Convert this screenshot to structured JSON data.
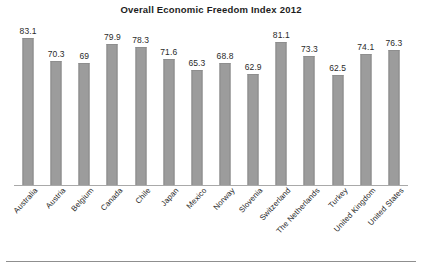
{
  "chart_data": {
    "type": "bar",
    "title": "Overall Economic Freedom Index 2012",
    "xlabel": "",
    "ylabel": "",
    "ylim": [
      0,
      90
    ],
    "grid": false,
    "legend": "none",
    "axis_visible": {
      "x": true,
      "y": false
    },
    "categories": [
      "Australia",
      "Austria",
      "Belgium",
      "Canada",
      "Chile",
      "Japan",
      "Mexico",
      "Norway",
      "Slovenia",
      "Switzerland",
      "The Netherlands",
      "Turkey",
      "United Kingdom",
      "United States"
    ],
    "values": [
      83.1,
      70.3,
      69,
      79.9,
      78.3,
      71.6,
      65.3,
      68.8,
      62.9,
      81.1,
      73.3,
      62.5,
      74.1,
      76.3
    ],
    "value_labels": [
      "83.1",
      "70.3",
      "69",
      "79.9",
      "78.3",
      "71.6",
      "65.3",
      "68.8",
      "62.9",
      "81.1",
      "73.3",
      "62.5",
      "74.1",
      "76.3"
    ],
    "series": [
      {
        "name": "Overall Economic Freedom Index 2012",
        "values": [
          83.1,
          70.3,
          69,
          79.9,
          78.3,
          71.6,
          65.3,
          68.8,
          62.9,
          81.1,
          73.3,
          62.5,
          74.1,
          76.3
        ]
      }
    ],
    "bar_color": "#9c9c9c",
    "bar_edge_color": "#8a8a8a",
    "axis_color": "#a9a9a9",
    "text_color": "#2a2a2a"
  }
}
